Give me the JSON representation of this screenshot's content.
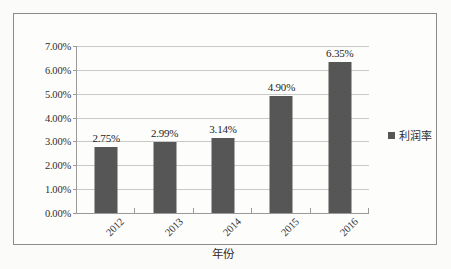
{
  "chart_data": {
    "type": "bar",
    "title": "",
    "categories": [
      "2012",
      "2013",
      "2014",
      "2015",
      "2016"
    ],
    "values": [
      2.75,
      2.99,
      3.14,
      4.9,
      6.35
    ],
    "data_labels": [
      "2.75%",
      "2.99%",
      "3.14%",
      "4.90%",
      "6.35%"
    ],
    "series": [
      {
        "name": "利润率",
        "values": [
          2.75,
          2.99,
          3.14,
          4.9,
          6.35
        ],
        "color": "#565656"
      }
    ],
    "xlabel": "年份",
    "ylabel": "",
    "ylim": [
      0,
      7
    ],
    "ytick_step": 1,
    "ytick_labels": [
      "0.00%",
      "1.00%",
      "2.00%",
      "3.00%",
      "4.00%",
      "5.00%",
      "6.00%",
      "7.00%"
    ],
    "grid": true,
    "legend_position": "right",
    "legend_entries": [
      "利润率"
    ],
    "xtick_rotation": -45
  },
  "legend": {
    "label": "利润率",
    "swatch_color": "#565656"
  },
  "axis": {
    "x_title": "年份"
  }
}
